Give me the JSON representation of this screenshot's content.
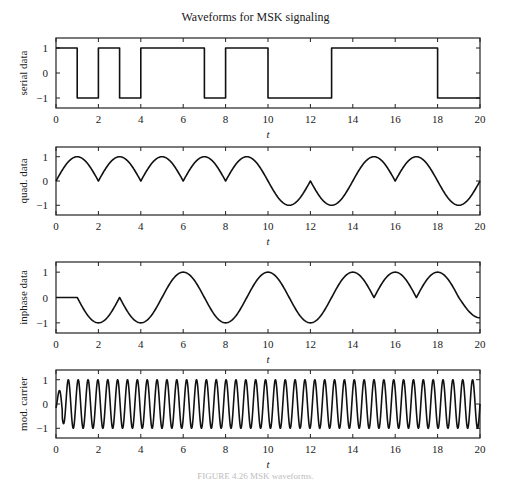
{
  "figure": {
    "title": "Waveforms for MSK signaling",
    "caption": "FIGURE 4.26  MSK waveforms."
  },
  "chart_data": [
    {
      "type": "line",
      "title": "Waveforms for MSK signaling",
      "xlabel": "t",
      "ylabel": "serial data",
      "xlim": [
        0,
        20
      ],
      "ylim": [
        -1.4,
        1.4
      ],
      "xticks": [
        0,
        2,
        4,
        6,
        8,
        10,
        12,
        14,
        16,
        18,
        20
      ],
      "yticks": [
        -1,
        0,
        1
      ],
      "grid": false,
      "style": "step",
      "bits": [
        1,
        -1,
        1,
        -1,
        1,
        1,
        1,
        -1,
        1,
        1,
        -1,
        -1,
        -1,
        1,
        1,
        1,
        1,
        1,
        -1,
        -1
      ]
    },
    {
      "type": "line",
      "xlabel": "t",
      "ylabel": "quad. data",
      "xlim": [
        0,
        20
      ],
      "ylim": [
        -1.4,
        1.4
      ],
      "xticks": [
        0,
        2,
        4,
        6,
        8,
        10,
        12,
        14,
        16,
        18,
        20
      ],
      "yticks": [
        -1,
        0,
        1
      ],
      "grid": false,
      "style": "sinusoid",
      "x": [
        0,
        1,
        2,
        3,
        4,
        5,
        6,
        7,
        8,
        9,
        10,
        11,
        12,
        13,
        14,
        15,
        16,
        17,
        18,
        19,
        20
      ],
      "y": [
        0,
        1,
        0,
        1,
        0,
        1,
        0,
        1,
        0,
        1,
        0,
        -1,
        0,
        -1,
        0,
        1,
        0,
        1,
        0,
        -1,
        0
      ]
    },
    {
      "type": "line",
      "xlabel": "t",
      "ylabel": "inphase data",
      "xlim": [
        0,
        20
      ],
      "ylim": [
        -1.4,
        1.4
      ],
      "xticks": [
        0,
        2,
        4,
        6,
        8,
        10,
        12,
        14,
        16,
        18,
        20
      ],
      "yticks": [
        -1,
        0,
        1
      ],
      "grid": false,
      "style": "sinusoid",
      "x": [
        0,
        1,
        2,
        3,
        4,
        5,
        6,
        7,
        8,
        9,
        10,
        11,
        12,
        13,
        14,
        15,
        16,
        17,
        18,
        19,
        20
      ],
      "y": [
        0,
        0,
        -1,
        0,
        -1,
        0,
        1,
        0,
        -1,
        0,
        1,
        0,
        -1,
        0,
        1,
        0,
        1,
        0,
        1,
        0,
        -0.8
      ]
    },
    {
      "type": "line",
      "xlabel": "t",
      "ylabel": "mod. carrier",
      "xlim": [
        0,
        20
      ],
      "ylim": [
        -1.4,
        1.4
      ],
      "xticks": [
        0,
        2,
        4,
        6,
        8,
        10,
        12,
        14,
        16,
        18,
        20
      ],
      "yticks": [
        -1,
        0,
        1
      ],
      "grid": false,
      "style": "carrier",
      "cycles": 43,
      "amplitude": 1
    }
  ]
}
